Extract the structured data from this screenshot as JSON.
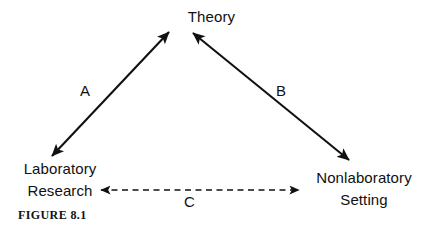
{
  "figure": {
    "caption": "FIGURE 8.1",
    "background_color": "#ffffff",
    "stroke_color": "#111111"
  },
  "nodes": {
    "theory": {
      "label": "Theory",
      "lines": [
        "Theory"
      ]
    },
    "laboratory": {
      "label": "Laboratory Research",
      "lines": [
        "Laboratory",
        "Research"
      ]
    },
    "nonlaboratory": {
      "label": "Nonlaboratory Setting",
      "lines": [
        "Nonlaboratory",
        "Setting"
      ]
    }
  },
  "edges": {
    "a": {
      "label": "A",
      "from": "laboratory",
      "to": "theory",
      "style": "solid",
      "arrows": "double"
    },
    "b": {
      "label": "B",
      "from": "theory",
      "to": "nonlaboratory",
      "style": "solid",
      "arrows": "double"
    },
    "c": {
      "label": "C",
      "from": "laboratory",
      "to": "nonlaboratory",
      "style": "dashed",
      "arrows": "double"
    }
  }
}
